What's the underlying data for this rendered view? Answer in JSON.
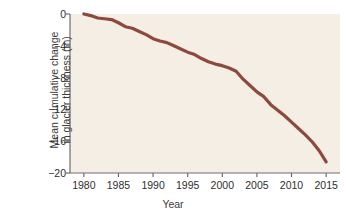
{
  "chart_data": {
    "type": "line",
    "title": "",
    "xlabel": "Year",
    "ylabel_line1": "Mean cumulative change",
    "ylabel_line2": "in glacier thickness (m)",
    "ylabel": "Mean cumulative change in glacier thickness (m)",
    "xlim": [
      1978,
      2017
    ],
    "ylim": [
      -20,
      0
    ],
    "xticks": [
      1980,
      1985,
      1990,
      1995,
      2000,
      2005,
      2010,
      2015
    ],
    "yticks": [
      0,
      -4,
      -8,
      -12,
      -16,
      -20
    ],
    "ytick_labels": [
      "0",
      "−4",
      "−8",
      "−12",
      "−16",
      "−20"
    ],
    "grid": false,
    "legend": "none",
    "series": [
      {
        "name": "Mean cumulative glacier thickness change",
        "color": "#8d4a3c",
        "x": [
          1980,
          1981,
          1982,
          1983,
          1984,
          1985,
          1986,
          1987,
          1988,
          1989,
          1990,
          1991,
          1992,
          1993,
          1994,
          1995,
          1996,
          1997,
          1998,
          1999,
          2000,
          2001,
          2002,
          2003,
          2004,
          2005,
          2006,
          2007,
          2008,
          2009,
          2010,
          2011,
          2012,
          2013,
          2014,
          2015
        ],
        "values": [
          0.0,
          -0.2,
          -0.5,
          -0.6,
          -0.7,
          -1.1,
          -1.6,
          -1.8,
          -2.2,
          -2.6,
          -3.1,
          -3.4,
          -3.6,
          -4.0,
          -4.4,
          -4.8,
          -5.1,
          -5.6,
          -6.0,
          -6.3,
          -6.5,
          -6.8,
          -7.2,
          -8.2,
          -9.0,
          -9.8,
          -10.4,
          -11.4,
          -12.1,
          -12.8,
          -13.6,
          -14.4,
          -15.2,
          -16.1,
          -17.2,
          -18.6
        ]
      }
    ]
  },
  "plot": {
    "background_color": "#f4eee4",
    "axis_color": "#6e6e6e",
    "text_color": "#2e2e2e",
    "line_color": "#8d4a3c"
  }
}
